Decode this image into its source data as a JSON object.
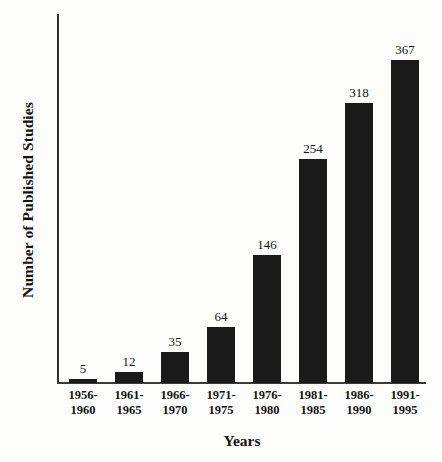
{
  "chart_data": {
    "type": "bar",
    "title": "",
    "subtitle": "",
    "xlabel": "Years",
    "ylabel": "Number of Published Studies",
    "categories": [
      "1956-1960",
      "1961-1965",
      "1966-1970",
      "1971-1975",
      "1976-1980",
      "1981-1985",
      "1986-1990",
      "1991-1995"
    ],
    "category_lines": [
      [
        "1956-",
        "1960"
      ],
      [
        "1961-",
        "1965"
      ],
      [
        "1966-",
        "1970"
      ],
      [
        "1971-",
        "1975"
      ],
      [
        "1976-",
        "1980"
      ],
      [
        "1981-",
        "1985"
      ],
      [
        "1986-",
        "1990"
      ],
      [
        "1991-",
        "1995"
      ]
    ],
    "values": [
      5,
      12,
      35,
      64,
      146,
      254,
      318,
      367
    ],
    "value_labels": [
      "5",
      "12",
      "35",
      "64",
      "146",
      "254",
      "318",
      "367"
    ],
    "ylim": [
      0,
      367
    ],
    "grid": false,
    "legend": false,
    "legend_position": "none",
    "axis_ticks_visible": false,
    "bar_color": "#1a1a1a",
    "axis_color": "#303030",
    "background_color": "#fdfdfb",
    "text_color": "#131313"
  }
}
